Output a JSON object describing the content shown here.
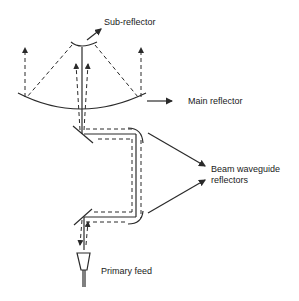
{
  "diagram": {
    "labels": {
      "sub_reflector": "Sub-reflector",
      "main_reflector": "Main reflector",
      "beam_waveguide_line1": "Beam waveguide",
      "beam_waveguide_line2": "reflectors",
      "primary_feed": "Primary feed"
    },
    "colors": {
      "line": "#2a2a2a",
      "background": "#ffffff"
    }
  }
}
